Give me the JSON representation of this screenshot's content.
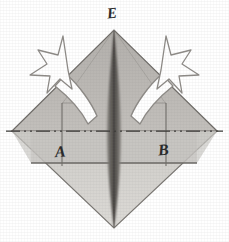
{
  "figure": {
    "background_color": "#ffffff",
    "width": 229,
    "height": 242,
    "labels": [
      {
        "id": "E",
        "text": "E",
        "position": "top-apex"
      },
      {
        "id": "A",
        "text": "A",
        "position": "left-of-center-below-midline"
      },
      {
        "id": "B",
        "text": "B",
        "position": "right-of-center-below-midline"
      }
    ],
    "shapes": {
      "diamond": {
        "name": "square-rotated-45",
        "top": [
          114,
          30
        ],
        "right": [
          217,
          131
        ],
        "bottom": [
          114,
          228
        ],
        "left": [
          12,
          131
        ],
        "upper_fill": "#b9b6b2",
        "lower_fill": "#d2d0cc",
        "stroke": "#6e6b67"
      },
      "spine": {
        "name": "center-crease-lens",
        "fill_dark": "#5d5a56",
        "fill_mid": "#8a8782",
        "top_y": 30,
        "bottom_y": 228,
        "max_half_width": 7
      },
      "centerline": {
        "name": "horizontal-dash-dot-centerline",
        "y": 131,
        "x_start": 6,
        "x_end": 223,
        "stroke": "#3a3836",
        "pattern": "dash-dot-dot"
      },
      "flap_lines": {
        "left_x": 62,
        "right_x": 166,
        "top_y": 104,
        "bottom_y": 163,
        "stroke": "#74716d"
      },
      "lower_flap_edge": {
        "y": 163,
        "x_start": 31,
        "x_end": 197,
        "stroke": "#6e6b67"
      }
    },
    "arrows": [
      {
        "id": "left-arrow",
        "name": "curved-arrow-left-outward",
        "direction": "up-and-left",
        "style": "outlined-white-curved",
        "fill": "#ffffff",
        "stroke": "#8d8a86",
        "head": "concave-star-arrowhead"
      },
      {
        "id": "right-arrow",
        "name": "curved-arrow-right-outward",
        "direction": "up-and-right",
        "style": "outlined-white-curved",
        "fill": "#ffffff",
        "stroke": "#8d8a86",
        "head": "concave-star-arrowhead"
      }
    ],
    "colors": {
      "paper_white": "#ffffff",
      "upper_gray": "#b9b6b2",
      "lower_gray": "#d2d0cc",
      "spine_dark": "#5d5a56",
      "ink": "#2b2b2b",
      "line_gray": "#6e6b67"
    }
  }
}
